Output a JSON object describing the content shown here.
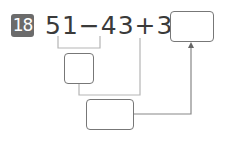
{
  "problem": {
    "number": "18",
    "expression": "51−43+38=",
    "terms": [
      "51",
      "43",
      "38"
    ],
    "operators": [
      "−",
      "+",
      "="
    ]
  },
  "boxes": {
    "answer": "",
    "intermediate": "",
    "final_helper": ""
  },
  "colors": {
    "badge": "#6b6b6b",
    "text": "#3a3a3a",
    "box_border": "#777777",
    "connector": "#b5b5b5"
  }
}
